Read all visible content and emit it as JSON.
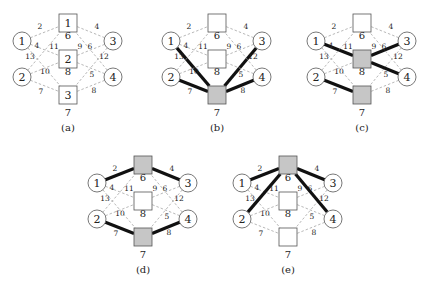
{
  "figure": {
    "nodes": {
      "circles": [
        {
          "id": "c1",
          "label": "1"
        },
        {
          "id": "c2",
          "label": "2"
        },
        {
          "id": "c3",
          "label": "3"
        },
        {
          "id": "c4",
          "label": "4"
        }
      ],
      "squares": [
        {
          "id": "s1",
          "label": "1",
          "cost": "6"
        },
        {
          "id": "s2",
          "label": "2",
          "cost": "8"
        },
        {
          "id": "s3",
          "label": "3",
          "cost": "7"
        }
      ]
    },
    "edges": [
      {
        "from": "c1",
        "to": "s1",
        "weight": "2"
      },
      {
        "from": "c1",
        "to": "s2",
        "weight": "4"
      },
      {
        "from": "c1",
        "to": "s3",
        "weight": "13"
      },
      {
        "from": "c2",
        "to": "s1",
        "weight": "11"
      },
      {
        "from": "c2",
        "to": "s2",
        "weight": "10"
      },
      {
        "from": "c2",
        "to": "s3",
        "weight": "7"
      },
      {
        "from": "c3",
        "to": "s1",
        "weight": "4"
      },
      {
        "from": "c3",
        "to": "s2",
        "weight": "6"
      },
      {
        "from": "c3",
        "to": "s3",
        "weight": "12"
      },
      {
        "from": "c4",
        "to": "s1",
        "weight": "9"
      },
      {
        "from": "c4",
        "to": "s2",
        "weight": "5"
      },
      {
        "from": "c4",
        "to": "s3",
        "weight": "8"
      }
    ],
    "colors": {
      "selected_fill": "#c6c6c6",
      "edge_dashed": "#9a9a9a",
      "edge_thick": "#111111",
      "node_stroke": "#555555"
    },
    "panels": [
      {
        "caption": "(a)",
        "show_square_numbers": true,
        "selected": [],
        "thick_edges": []
      },
      {
        "caption": "(b)",
        "show_square_numbers": false,
        "selected": [
          "s3"
        ],
        "thick_edges": [
          "c1-s3",
          "c2-s3",
          "c3-s3",
          "c4-s3"
        ]
      },
      {
        "caption": "(c)",
        "show_square_numbers": false,
        "selected": [
          "s2",
          "s3"
        ],
        "thick_edges": [
          "c1-s2",
          "c3-s2",
          "c4-s2",
          "c2-s3"
        ]
      },
      {
        "caption": "(d)",
        "show_square_numbers": false,
        "selected": [
          "s1",
          "s3"
        ],
        "thick_edges": [
          "c1-s1",
          "c3-s1",
          "c2-s3",
          "c4-s3"
        ]
      },
      {
        "caption": "(e)",
        "show_square_numbers": false,
        "selected": [
          "s1"
        ],
        "thick_edges": [
          "c1-s1",
          "c2-s1",
          "c3-s1",
          "c4-s1"
        ]
      }
    ]
  }
}
